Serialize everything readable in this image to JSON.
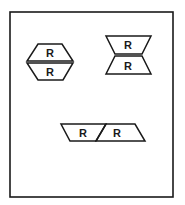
{
  "figure": {
    "frame": {
      "x": 10,
      "y": 12,
      "width": 163,
      "height": 185,
      "stroke": "#1a1a1a"
    },
    "shapes": [
      {
        "id": "hexagon-pair",
        "description": "two trapezoids joined along long base forming a hexagon",
        "top_label": "R",
        "bottom_label": "R"
      },
      {
        "id": "bowtie-pair",
        "description": "two trapezoids joined along short base forming a bowtie",
        "top_label": "R",
        "bottom_label": "R"
      },
      {
        "id": "parallelogram-pair",
        "description": "two parallelograms joined along a slanted edge",
        "left_label": "R",
        "right_label": "R"
      }
    ],
    "stroke_color": "#1a1a1a",
    "background": "#ffffff"
  }
}
